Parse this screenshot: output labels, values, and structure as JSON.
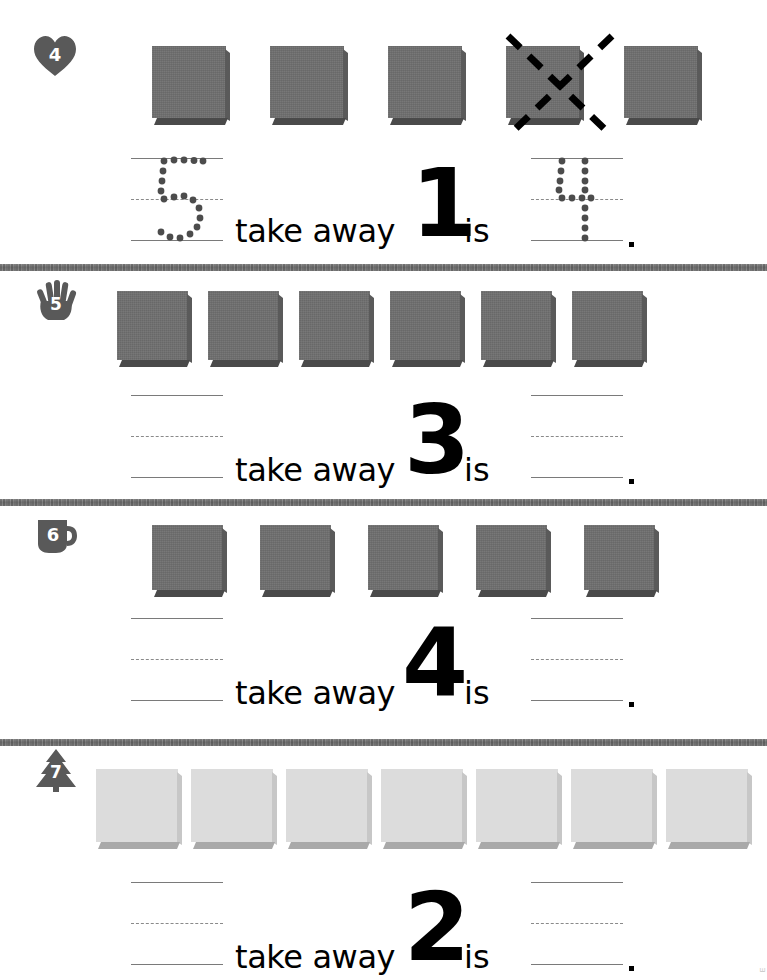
{
  "page": {
    "width": 767,
    "height": 980,
    "background": "#ffffff",
    "margin_mark": "E"
  },
  "colors": {
    "cube_dark_face": "#6e6e6e",
    "cube_dark_shadow": "#4a4a4a",
    "cube_light_face": "#dcdcdc",
    "cube_light_shadow": "#a9a9a9",
    "guide_line": "#7a7a7a",
    "divider": "#9a9a9a",
    "text": "#000000",
    "badge_fill": "#595959"
  },
  "labels": {
    "take_away": "take away",
    "is": "is",
    "period": "."
  },
  "problems": [
    {
      "id": "problem-4",
      "number": "4",
      "badge_icon": "heart-icon",
      "cube_count": 5,
      "cube_style": "dark",
      "crossed_out_indices": [
        4
      ],
      "left_blank": {
        "traced": true,
        "traced_value": "5"
      },
      "subtrahend": "1",
      "right_blank": {
        "traced": true,
        "traced_value": "4"
      }
    },
    {
      "id": "problem-5",
      "number": "5",
      "badge_icon": "hand-icon",
      "cube_count": 6,
      "cube_style": "dark",
      "crossed_out_indices": [],
      "left_blank": {
        "traced": false,
        "traced_value": ""
      },
      "subtrahend": "3",
      "right_blank": {
        "traced": false,
        "traced_value": ""
      }
    },
    {
      "id": "problem-6",
      "number": "6",
      "badge_icon": "mug-icon",
      "cube_count": 5,
      "cube_style": "dark",
      "crossed_out_indices": [],
      "left_blank": {
        "traced": false,
        "traced_value": ""
      },
      "subtrahend": "4",
      "right_blank": {
        "traced": false,
        "traced_value": ""
      }
    },
    {
      "id": "problem-7",
      "number": "7",
      "badge_icon": "tree-icon",
      "cube_count": 7,
      "cube_style": "light",
      "crossed_out_indices": [],
      "left_blank": {
        "traced": false,
        "traced_value": ""
      },
      "subtrahend": "2",
      "right_blank": {
        "traced": false,
        "traced_value": ""
      }
    }
  ]
}
